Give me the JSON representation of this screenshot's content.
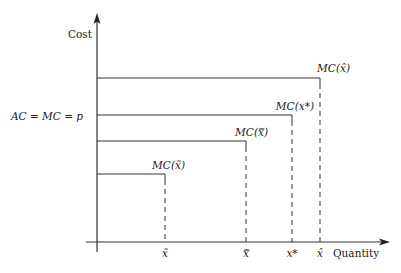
{
  "axes": {
    "y_label": "Cost",
    "x_label": "Quantity",
    "price_label": "AC = MC = p"
  },
  "levels": [
    {
      "mc_label": "MC(x̂)",
      "x_label": "x̂",
      "y": 78,
      "x": 320
    },
    {
      "mc_label": "MC(x*)",
      "x_label": "x*",
      "y": 115,
      "x": 292
    },
    {
      "mc_label": "MC(x̿)",
      "x_label": "x̿",
      "y": 141,
      "x": 246
    },
    {
      "mc_label": "MC(x̃)",
      "x_label": "x̃",
      "y": 174,
      "x": 165
    }
  ],
  "colors": {
    "line": "#333333"
  }
}
